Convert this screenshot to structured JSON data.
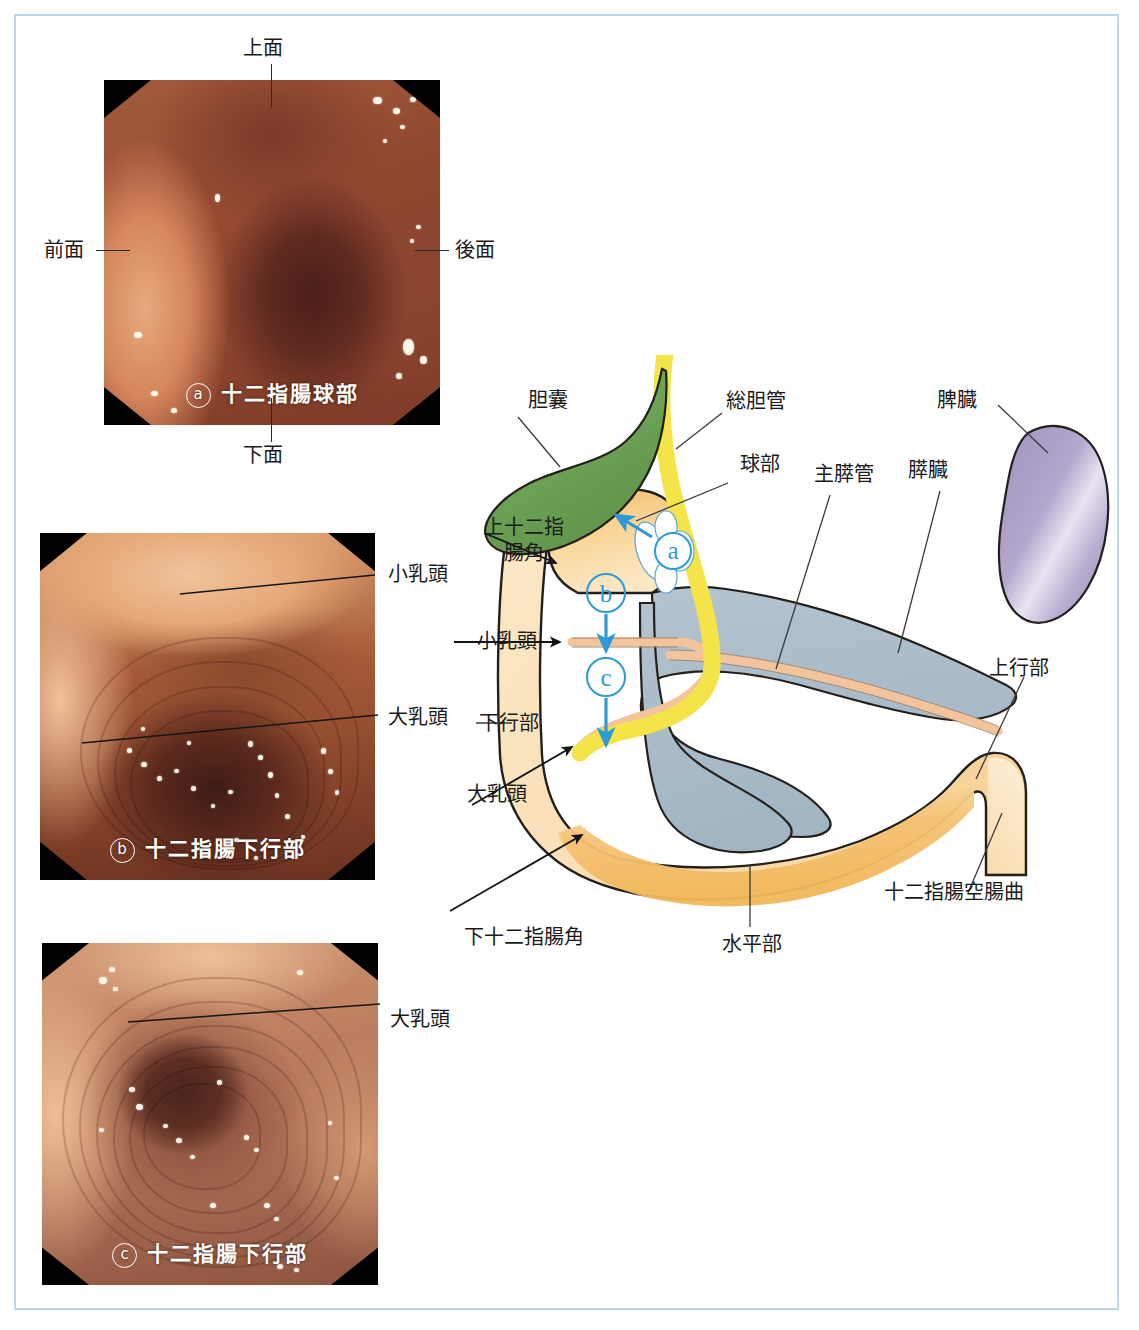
{
  "page": {
    "border_color": "#bcd9ea",
    "background": "#ffffff"
  },
  "endoscopy_plates": [
    {
      "id": "a",
      "mark": "ⓐ",
      "caption": "十二指腸球部",
      "caption_mark": "a",
      "labels": [
        {
          "name": "top",
          "text": "上面"
        },
        {
          "name": "left",
          "text": "前面"
        },
        {
          "name": "right",
          "text": "後面"
        },
        {
          "name": "bottom",
          "text": "下面"
        }
      ]
    },
    {
      "id": "b",
      "mark": "ⓑ",
      "caption": "十二指腸下行部",
      "caption_mark": "b",
      "labels": [
        {
          "name": "minor-papilla",
          "text": "小乳頭"
        },
        {
          "name": "major-papilla",
          "text": "大乳頭"
        }
      ]
    },
    {
      "id": "c",
      "mark": "ⓒ",
      "caption": "十二指腸下行部",
      "caption_mark": "c",
      "labels": [
        {
          "name": "major-papilla",
          "text": "大乳頭"
        }
      ]
    }
  ],
  "diagram": {
    "labels": {
      "gallbladder": "胆囊",
      "common_bile_duct": "総胆管",
      "bulb": "球部",
      "main_pancreatic_duct": "主膵管",
      "pancreas": "膵臓",
      "spleen": "脾臓",
      "superior_duodenal_flexure": "上十二指\n腸角",
      "superior_duodenal_flexure_l1": "上十二指",
      "superior_duodenal_flexure_l2": "腸角",
      "minor_papilla": "小乳頭",
      "descending_part": "下行部",
      "major_papilla": "大乳頭",
      "inferior_duodenal_flexure": "下十二指腸角",
      "horizontal_part": "水平部",
      "ascending_part": "上行部",
      "duodenojejunal_flexure": "十二指腸空腸曲"
    },
    "view_markers": [
      {
        "id": "a",
        "label": "a"
      },
      {
        "id": "b",
        "label": "b"
      },
      {
        "id": "c",
        "label": "c"
      }
    ],
    "colors": {
      "gallbladder": "#6aa05a",
      "bile_duct": "#f5e34a",
      "duodenum_light": "#fae6c0",
      "duodenum_mid": "#f6cf8f",
      "duodenum_deep": "#f2b95f",
      "pancreas": "#a9bcc9",
      "pancreatic_duct": "#f3c49c",
      "spleen": "#a99cc4",
      "marker_blue": "#2d9ad6",
      "outline": "#231f1c"
    }
  }
}
